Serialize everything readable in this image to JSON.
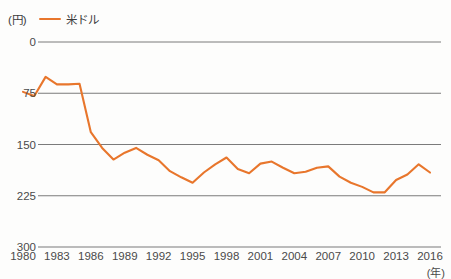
{
  "legend": {
    "unit_label": "(円)",
    "series_label": "米ドル",
    "series_color": "#e8762c"
  },
  "axes": {
    "x_unit_label": "(年)",
    "y_ticks": [
      "300",
      "225",
      "150",
      "75",
      "0"
    ],
    "x_ticks": [
      "1980",
      "1983",
      "1986",
      "1989",
      "1992",
      "1995",
      "1998",
      "2001",
      "2004",
      "2007",
      "2010",
      "2013",
      "2016"
    ]
  },
  "chart_data": {
    "type": "line",
    "title": "",
    "subtitle": "",
    "xlabel": "(年)",
    "ylabel": "(円)",
    "xlim": [
      1980,
      2016
    ],
    "ylim": [
      0,
      300
    ],
    "grid": true,
    "legend_position": "top-left",
    "y_ticks": [
      0,
      75,
      150,
      225,
      300
    ],
    "x_ticks": [
      1980,
      1983,
      1986,
      1989,
      1992,
      1995,
      1998,
      2001,
      2004,
      2007,
      2010,
      2013,
      2016
    ],
    "x": [
      1980,
      1981,
      1982,
      1983,
      1984,
      1985,
      1986,
      1987,
      1988,
      1989,
      1990,
      1991,
      1992,
      1993,
      1994,
      1995,
      1996,
      1997,
      1998,
      1999,
      2000,
      2001,
      2002,
      2003,
      2004,
      2005,
      2006,
      2007,
      2008,
      2009,
      2010,
      2011,
      2012,
      2013,
      2014,
      2015,
      2016
    ],
    "series": [
      {
        "name": "米ドル",
        "color": "#e8762c",
        "values": [
          227,
          221,
          249,
          238,
          238,
          239,
          168,
          145,
          128,
          138,
          145,
          135,
          127,
          111,
          102,
          94,
          109,
          121,
          131,
          114,
          108,
          122,
          125,
          116,
          108,
          110,
          116,
          118,
          103,
          94,
          88,
          80,
          80,
          98,
          106,
          121,
          109
        ]
      }
    ]
  }
}
